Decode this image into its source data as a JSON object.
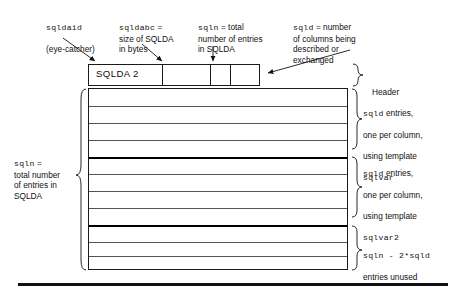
{
  "diagram": {
    "callouts": [
      {
        "id": "sqldaid",
        "mono_term": "sqldaid",
        "text": "(eye-catcher)"
      },
      {
        "id": "sqldabc",
        "mono_term": "sqldabc",
        "text": " =\nsize of SQLDA\nin bytes"
      },
      {
        "id": "sqln",
        "mono_term": "sqln",
        "text": " = total\nnumber of entries\nin SQLDA"
      },
      {
        "id": "sqld",
        "mono_term": "sqld",
        "text": " = number\nof columns being\ndescribed or\nexchanged"
      }
    ],
    "header": {
      "cell_label": "SQLDA 2",
      "bracket_label": "Header",
      "cell_count": 4
    },
    "left_label": {
      "mono_term": "sqln",
      "text": " =\ntotal number\nof entries in\nSQLDA"
    },
    "right_labels": [
      {
        "id": "sqlvar-group",
        "line1_mono": "sqld",
        "line1_rest": " entries,",
        "line2": "one per column,",
        "line3": "using template",
        "line4_mono": "sqlvar"
      },
      {
        "id": "sqlvar2-group",
        "line1_mono": "sqld",
        "line1_rest": " entries,",
        "line2": "one per column,",
        "line3": "using template",
        "line4_mono": "sqlvar2"
      },
      {
        "id": "unused-group",
        "line1_mono": "sqln - 2*sqld",
        "line2": "entries unused"
      }
    ],
    "colors": {
      "ink": "#111111",
      "rule": "#555555",
      "thick_rule": "#000000",
      "background": "#ffffff"
    }
  }
}
